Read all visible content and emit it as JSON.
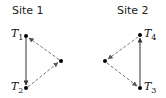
{
  "sites": [
    {
      "title": "Site 1",
      "nodes": [
        {
          "id": "T1",
          "label": "T",
          "sub": "1"
        },
        {
          "id": "T2",
          "label": "T",
          "sub": "2"
        },
        {
          "id": "P1",
          "label": ""
        }
      ],
      "edges": [
        {
          "from": "T1",
          "to": "T2",
          "style": "solid"
        },
        {
          "from": "T2",
          "to": "P1",
          "style": "dashed"
        },
        {
          "from": "P1",
          "to": "T1",
          "style": "dashed"
        }
      ]
    },
    {
      "title": "Site 2",
      "nodes": [
        {
          "id": "T4",
          "label": "T",
          "sub": "4"
        },
        {
          "id": "T3",
          "label": "T",
          "sub": "3"
        },
        {
          "id": "P2",
          "label": ""
        }
      ],
      "edges": [
        {
          "from": "T3",
          "to": "T4",
          "style": "solid"
        },
        {
          "from": "T4",
          "to": "P2",
          "style": "dashed"
        },
        {
          "from": "P2",
          "to": "T3",
          "style": "dashed"
        }
      ]
    }
  ],
  "colors": {
    "solid": "#333333",
    "dashed": "#777777",
    "node": "#000000"
  }
}
